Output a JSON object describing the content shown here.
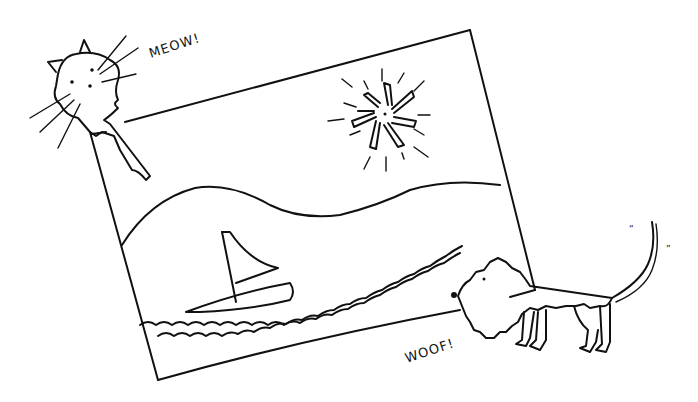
{
  "illustration": {
    "style": "hand-drawn black ink line drawing on white",
    "colors": {
      "ink": "#111111",
      "paper": "#ffffff"
    },
    "picture_frame": {
      "description": "tilted rectangular picture",
      "contents": [
        "sun with rays",
        "rolling hills",
        "sailboat",
        "wavy water lines"
      ]
    },
    "cat": {
      "position": "top-left, peeking over frame corner",
      "speech": "MEOW!"
    },
    "dog": {
      "position": "bottom-right, standing in front of frame",
      "speech": "WOOF!",
      "tail_marks": [
        "“",
        "”"
      ]
    }
  }
}
